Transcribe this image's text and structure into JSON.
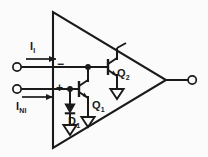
{
  "diagram": {
    "background_color": "#fbfbfb",
    "ink_color": "#1a1a1a",
    "amplifier": {
      "shape": "triangle",
      "input_polarity_inverting": "−",
      "input_polarity_noninverting": "+"
    },
    "labels": {
      "inverting_current": {
        "symbol": "I",
        "subscript": "I"
      },
      "noninverting_current": {
        "symbol": "I",
        "subscript": "NI"
      },
      "transistor_upper": {
        "symbol": "Q",
        "subscript": "2"
      },
      "transistor_lower": {
        "symbol": "Q",
        "subscript": "1"
      },
      "diode": {
        "symbol": "D",
        "subscript": "1"
      }
    },
    "terminals": [
      {
        "name": "inverting-input-terminal",
        "type": "open-circle"
      },
      {
        "name": "noninverting-input-terminal",
        "type": "open-circle"
      },
      {
        "name": "output-terminal",
        "type": "open-circle"
      }
    ],
    "ground_symbols": [
      {
        "name": "ground-diode"
      },
      {
        "name": "ground-q1-emitter"
      },
      {
        "name": "ground-q2-emitter"
      }
    ],
    "current_arrows": [
      {
        "name": "current-arrow-inverting",
        "direction": "right"
      },
      {
        "name": "current-arrow-noninverting",
        "direction": "right"
      }
    ],
    "junction_nodes": [
      {
        "name": "node-inverting"
      },
      {
        "name": "node-noninverting"
      }
    ]
  }
}
